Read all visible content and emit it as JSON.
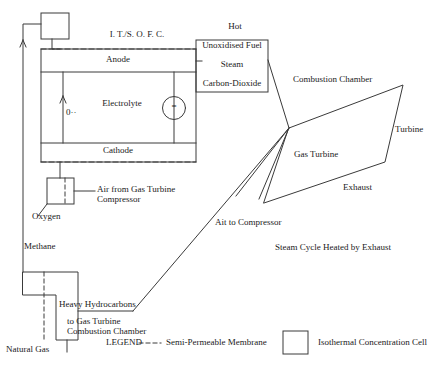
{
  "diagram": {
    "stroke_color": "#3a3a3a",
    "background_color": "#ffffff"
  },
  "fuel_cell": {
    "header": "I. T./S. O. F. C.",
    "anode": "Anode",
    "electrolyte": "Electrolyte",
    "cathode": "Cathode",
    "ion_label": "0··",
    "load_symbol": "=",
    "load_name": "dc-load"
  },
  "outlet_box": {
    "hot": "Hot",
    "lines": [
      "Unoxidised Fuel",
      "Steam",
      "Carbon-Dioxide"
    ]
  },
  "gas_turbine": {
    "combustion_chamber": "Combustion Chamber",
    "body": "Gas Turbine",
    "turbine": "Turbine",
    "exhaust": "Exhaust",
    "air_to_compressor": "Ait to Compressor",
    "steam_cycle": "Steam Cycle Heated by Exhaust"
  },
  "feeds": {
    "oxygen": "Oxygen",
    "air_from_compressor": "Air from Gas Turbine\nCompressor",
    "methane": "Methane",
    "heavy_hydrocarbons": "Heavy Hydrocarbons",
    "to_combustion": "to Gas Turbine\nCombustion Chamber",
    "natural_gas": "Natural Gas"
  },
  "legend": {
    "title": "LEGEND",
    "membrane_label": "Semi-Permeable Membrane",
    "membrane_glyph": "– – –",
    "cell_label": "Isothermal Concentration Cell"
  }
}
